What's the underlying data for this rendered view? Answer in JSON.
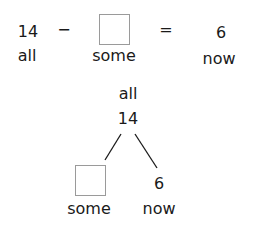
{
  "equation": {
    "total": "14",
    "minus": "−",
    "equals": "=",
    "result": "6",
    "labels": {
      "total": "all",
      "part": "some",
      "result": "now"
    }
  },
  "number_bond": {
    "top_label": "all",
    "top_value": "14",
    "left_label": "some",
    "right_value": "6",
    "right_label": "now"
  },
  "colors": {
    "text": "#1a1a1a",
    "box_border": "#9a9a9a",
    "lines": "#1a1a1a"
  }
}
